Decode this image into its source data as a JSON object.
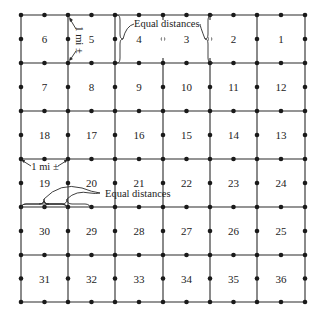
{
  "diagram": {
    "grid": {
      "columns": 6,
      "rows": 6,
      "x_lines": [
        21,
        68,
        115,
        163,
        210,
        257,
        305
      ],
      "y_lines": [
        15,
        63,
        111,
        159,
        207,
        255,
        302
      ]
    },
    "sections": [
      [
        6,
        5,
        4,
        3,
        2,
        1
      ],
      [
        7,
        8,
        9,
        10,
        11,
        12
      ],
      [
        18,
        17,
        16,
        15,
        14,
        13
      ],
      [
        19,
        20,
        21,
        22,
        23,
        24
      ],
      [
        30,
        29,
        28,
        27,
        26,
        25
      ],
      [
        31,
        32,
        33,
        34,
        35,
        36
      ]
    ],
    "annotations": {
      "mile_vertical": "1 mi ±",
      "mile_horizontal": "1 mi ±",
      "equal_distances_top": "Equal distances",
      "equal_distances_bottom": "Equal distances"
    },
    "colors": {
      "line": "#2a2a2a",
      "node": "#1a1a1a",
      "text": "#222222",
      "background": "#ffffff"
    }
  }
}
